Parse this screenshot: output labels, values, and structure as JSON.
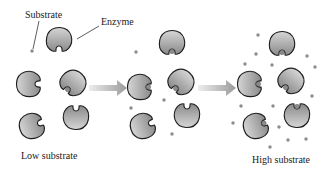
{
  "labels": {
    "substrate": "Substrate",
    "enzyme": "Enzyme",
    "low": "Low substrate",
    "high": "High substrate"
  },
  "colors": {
    "enzyme_fill_light": "#d4d4d4",
    "enzyme_fill_dark": "#8a8a8a",
    "enzyme_outline": "#1e1e1e",
    "substrate": "#8c8c8c",
    "arrow_light": "#e6e6e6",
    "arrow_dark": "#9a9a9a"
  },
  "panels": [
    {
      "name": "low-substrate",
      "enzymes": 5,
      "bound": 1,
      "free_substrate": 1
    },
    {
      "name": "medium-substrate",
      "enzymes": 5,
      "bound": 3,
      "free_substrate": 6
    },
    {
      "name": "high-substrate",
      "enzymes": 5,
      "bound": 5,
      "free_substrate": 16
    }
  ]
}
